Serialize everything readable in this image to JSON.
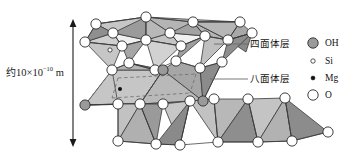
{
  "figure": {
    "kind": "crystal-structure-diagram",
    "background_color": "#ffffff",
    "stroke_color": "#1a1a1a"
  },
  "scale": {
    "prefix": "约",
    "mantissa": "10×10",
    "exponent": "−10",
    "unit": " m",
    "full_text": "约10×10⁻¹⁰ m",
    "arrow_name": "scale-arrow",
    "arrow_top_y": 20,
    "arrow_bottom_y": 146
  },
  "callouts": [
    {
      "key": "tetrahedral",
      "label": "四面体层",
      "leader_from_x": 215,
      "leader_to_x": 248,
      "y": 44
    },
    {
      "key": "octahedral",
      "label": "八面体层",
      "leader_from_x": 212,
      "leader_to_x": 248,
      "y": 79
    }
  ],
  "legend": {
    "name": "legend",
    "items": [
      {
        "key": "oh",
        "label": "OH",
        "marker": "filled-gray-circle",
        "radius": 5.2,
        "fill": "#9a9a9a",
        "stroke": "#2b2b2b",
        "cx": 313,
        "cy": 43
      },
      {
        "key": "si",
        "label": "Si",
        "marker": "small-open-circle",
        "radius": 2.2,
        "fill": "#ffffff",
        "stroke": "#2b2b2b",
        "cx": 313,
        "cy": 61
      },
      {
        "key": "mg",
        "label": "Mg",
        "marker": "small-filled-circle",
        "radius": 2.0,
        "fill": "#111111",
        "stroke": "#111111",
        "cx": 313,
        "cy": 78
      },
      {
        "key": "o",
        "label": "O",
        "marker": "large-open-circle",
        "radius": 5.2,
        "fill": "#ffffff",
        "stroke": "#2b2b2b",
        "cx": 313,
        "cy": 95
      }
    ]
  },
  "palette": {
    "face_light": "#c9c9c9",
    "face_mid": "#b0b0b0",
    "face_dark": "#8d8d8d",
    "face_darker": "#7b7b7b",
    "face_white": "#f2f2f2",
    "oh_fill": "#9a9a9a",
    "o_fill": "#ffffff",
    "mg_fill": "#111111",
    "edge": "#3a3a3a",
    "hidden_edge": "#6d6d6d"
  },
  "atoms": {
    "top_row_o": [
      {
        "cx": 96,
        "cy": 24
      },
      {
        "cx": 146,
        "cy": 17
      },
      {
        "cx": 193,
        "cy": 22
      },
      {
        "cx": 240,
        "cy": 22
      }
    ],
    "upper_o": [
      {
        "cx": 85,
        "cy": 42
      },
      {
        "cx": 113,
        "cy": 33
      },
      {
        "cx": 122,
        "cy": 46
      },
      {
        "cx": 146,
        "cy": 40
      },
      {
        "cx": 170,
        "cy": 33
      },
      {
        "cx": 181,
        "cy": 46
      },
      {
        "cx": 205,
        "cy": 36
      },
      {
        "cx": 228,
        "cy": 40
      }
    ],
    "mid_o": [
      {
        "cx": 112,
        "cy": 70
      },
      {
        "cx": 129,
        "cy": 63
      },
      {
        "cx": 155,
        "cy": 70
      },
      {
        "cx": 176,
        "cy": 61
      },
      {
        "cx": 200,
        "cy": 68
      },
      {
        "cx": 222,
        "cy": 62
      }
    ],
    "lower_o": [
      {
        "cx": 118,
        "cy": 104
      },
      {
        "cx": 140,
        "cy": 104
      },
      {
        "cx": 190,
        "cy": 101
      },
      {
        "cx": 214,
        "cy": 99
      },
      {
        "cx": 248,
        "cy": 99
      },
      {
        "cx": 285,
        "cy": 98
      }
    ],
    "bottom_o": [
      {
        "cx": 118,
        "cy": 141
      },
      {
        "cx": 156,
        "cy": 144
      },
      {
        "cx": 180,
        "cy": 145
      },
      {
        "cx": 218,
        "cy": 142
      },
      {
        "cx": 258,
        "cy": 142
      },
      {
        "cx": 292,
        "cy": 141
      },
      {
        "cx": 328,
        "cy": 132
      }
    ],
    "oh": [
      {
        "cx": 163,
        "cy": 70
      },
      {
        "cx": 85,
        "cy": 105
      },
      {
        "cx": 203,
        "cy": 101
      }
    ],
    "si": [
      {
        "cx": 110,
        "cy": 50
      }
    ],
    "mg": [
      {
        "cx": 120,
        "cy": 89
      }
    ]
  }
}
